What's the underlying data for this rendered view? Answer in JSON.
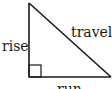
{
  "diagram": {
    "type": "right-triangle",
    "labels": {
      "rise": "rise",
      "travel": "travel",
      "run": "run"
    },
    "colors": {
      "stroke": "#1a1a1a",
      "background": "#ffffff"
    },
    "vertices": {
      "apex": [
        29,
        3
      ],
      "right_angle": [
        29,
        77
      ],
      "base_end": [
        111,
        77
      ]
    },
    "right_angle_marker_size": 12
  }
}
